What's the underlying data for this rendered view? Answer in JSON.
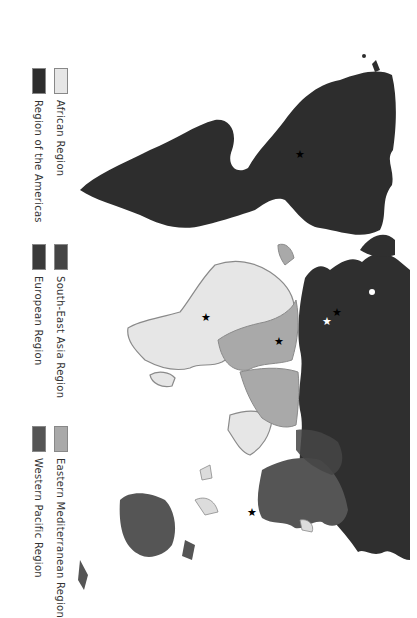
{
  "legend": {
    "items": [
      {
        "label": "African Region",
        "color": "#e6e6e6"
      },
      {
        "label": "Region of the Americas",
        "color": "#2d2d2d"
      },
      {
        "label": "South-East Asia Region",
        "color": "#454545"
      },
      {
        "label": "European Region",
        "color": "#3a3a3a"
      },
      {
        "label": "Eastern Mediterranean Region",
        "color": "#a9a9a9"
      },
      {
        "label": "Western Pacific Region",
        "color": "#555555"
      }
    ]
  },
  "map": {
    "orientation": "rotated 90 degrees clockwise",
    "markers": [
      {
        "type": "star",
        "color": "#000000",
        "region": "Region of the Americas"
      },
      {
        "type": "star",
        "color": "#000000",
        "region": "African Region"
      },
      {
        "type": "star",
        "color": "#000000",
        "region": "Eastern Mediterranean Region"
      },
      {
        "type": "star",
        "color": "#000000",
        "region": "European Region"
      },
      {
        "type": "star",
        "color": "#ffffff",
        "region": "European Region"
      },
      {
        "type": "star",
        "color": "#000000",
        "region": "Western Pacific Region"
      }
    ]
  }
}
